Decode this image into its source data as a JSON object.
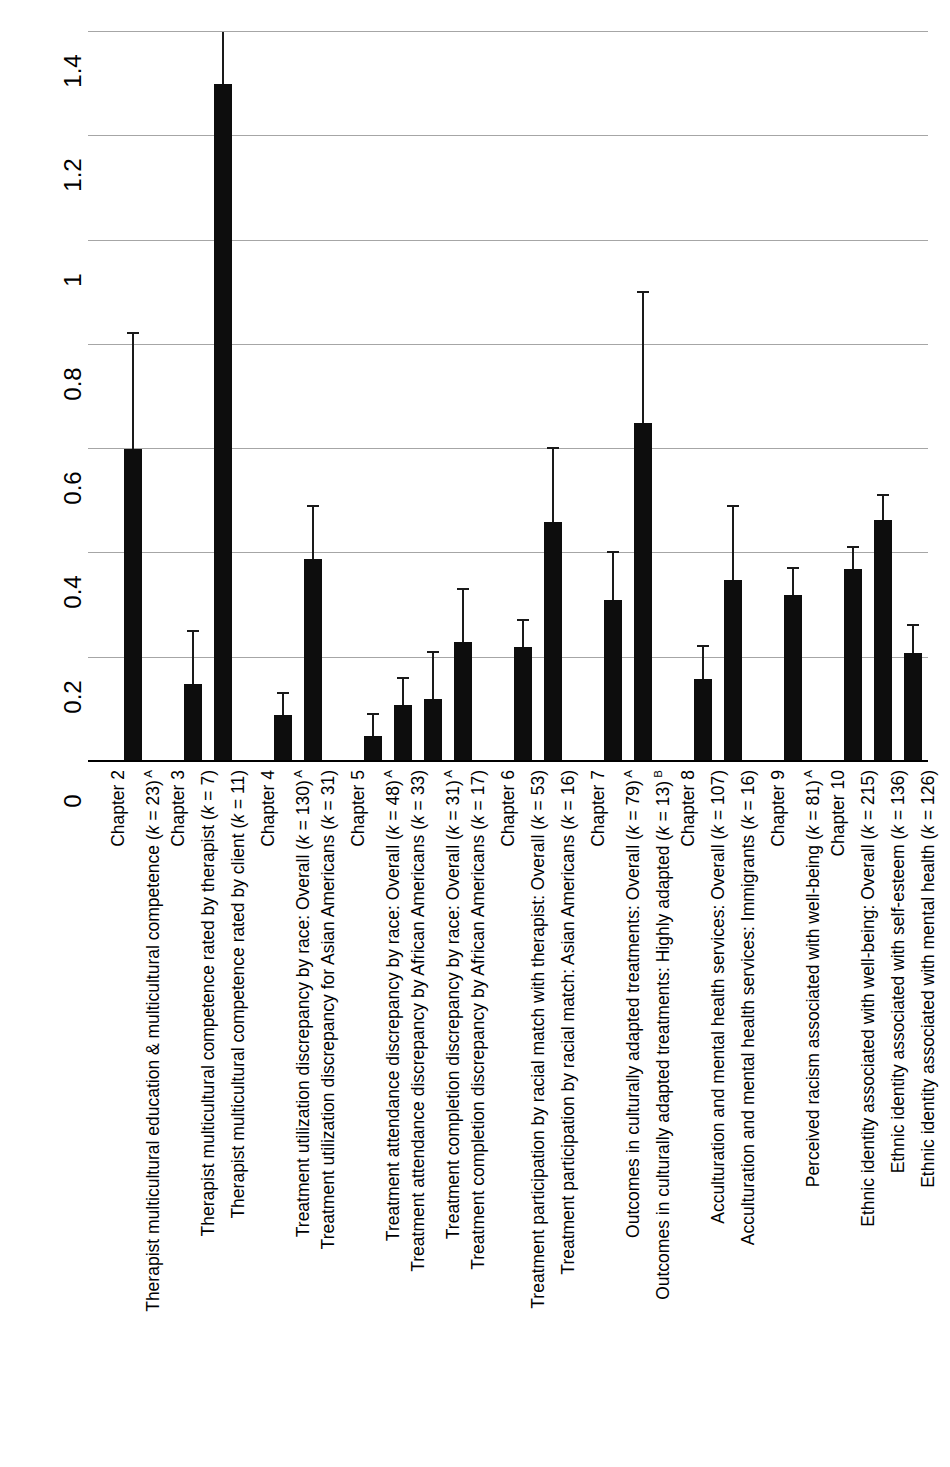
{
  "chart_data": {
    "type": "bar",
    "title": "",
    "xlabel": "",
    "ylabel": "",
    "ylim": [
      0,
      1.4
    ],
    "grid": true,
    "legend": "none",
    "orientation": "vertical-bars-rotated-labels",
    "yticks": [
      "0",
      "0.2",
      "0.4",
      "0.6",
      "0.8",
      "1",
      "1.2",
      "1.4"
    ],
    "ytick_values": [
      0,
      0.2,
      0.4,
      0.6,
      0.8,
      1,
      1.2,
      1.4
    ],
    "categories": [
      "Chapter 2",
      "Therapist multicultural education & multicultural competence (k = 23) A",
      "Chapter 3",
      "Therapist multicultural competence rated by therapist (k = 7)",
      "Therapist multicultural competence rated by client (k = 11)",
      "Chapter 4",
      "Treatment utilization discrepancy by race: Overall (k = 130) A",
      "Treatment utilization discrepancy for Asian Americans (k = 31)",
      "Chapter 5",
      "Treatment attendance discrepancy by race: Overall (k = 48) A",
      "Treatment attendance discrepancy by African Americans (k = 33)",
      "Treatment completion discrepancy by race: Overall (k = 31) A",
      "Treatment completion discrepancy by African Americans (k = 17)",
      "Chapter 6",
      "Treatment participation by racial match with therapist: Overall (k = 53)",
      "Treatment participation by racial match: Asian Americans (k = 16)",
      "Chapter 7",
      "Outcomes in culturally adapted treatments: Overall (k = 79) A",
      "Outcomes in culturally adapted treatments: Highly adapted (k = 13) B",
      "Chapter 8",
      "Acculturation and mental health services: Overall (k = 107)",
      "Acculturation and mental health services: Immigrants (k = 16)",
      "Chapter 9",
      "Perceived racism associated with well-being (k = 81) A",
      "Chapter 10",
      "Ethnic identity associated with well-being: Overall (k = 215)",
      "Ethnic identity associated with self-esteem (k = 136)",
      "Ethnic identity associated with mental health (k = 126)"
    ],
    "values": [
      null,
      0.6,
      null,
      0.15,
      1.3,
      null,
      0.09,
      0.39,
      null,
      0.05,
      0.11,
      0.12,
      0.23,
      null,
      0.22,
      0.46,
      null,
      0.31,
      0.65,
      null,
      0.16,
      0.35,
      null,
      0.32,
      null,
      0.37,
      0.465,
      0.21
    ],
    "error_high": [
      null,
      0.82,
      null,
      0.25,
      1.4,
      null,
      0.13,
      0.49,
      null,
      0.09,
      0.16,
      0.21,
      0.33,
      null,
      0.27,
      0.6,
      null,
      0.4,
      0.9,
      null,
      0.22,
      0.49,
      null,
      0.37,
      null,
      0.41,
      0.51,
      0.26
    ],
    "slots": [
      {
        "label": "Chapter 2",
        "type": "chapter"
      },
      {
        "label": "Therapist multicultural education & multicultural competence (",
        "k": "k",
        "ktail": " = 23)",
        "sup": "A",
        "type": "bar",
        "value": 0.6,
        "error_high": 0.82
      },
      {
        "label": "Chapter 3",
        "type": "chapter"
      },
      {
        "label": "Therapist multicultural competence rated by therapist (",
        "k": "k",
        "ktail": " = 7)",
        "sup": "",
        "type": "bar",
        "value": 0.15,
        "error_high": 0.25
      },
      {
        "label": "Therapist multicultural competence rated by client (",
        "k": "k",
        "ktail": " = 11)",
        "sup": "",
        "type": "bar",
        "value": 1.3,
        "error_high": 1.4
      },
      {
        "label": "Chapter 4",
        "type": "chapter"
      },
      {
        "label": "Treatment utilization discrepancy by race: Overall (",
        "k": "k",
        "ktail": " = 130)",
        "sup": "A",
        "type": "bar",
        "value": 0.09,
        "error_high": 0.13
      },
      {
        "label": "Treatment utilization discrepancy for Asian Americans (",
        "k": "k",
        "ktail": " = 31)",
        "sup": "",
        "type": "bar",
        "value": 0.39,
        "error_high": 0.49
      },
      {
        "label": "Chapter 5",
        "type": "chapter"
      },
      {
        "label": "Treatment attendance discrepancy by race: Overall (",
        "k": "k",
        "ktail": " = 48)",
        "sup": "A",
        "type": "bar",
        "value": 0.05,
        "error_high": 0.09
      },
      {
        "label": "Treatment attendance discrepancy by African Americans (",
        "k": "k",
        "ktail": " = 33)",
        "sup": "",
        "type": "bar",
        "value": 0.11,
        "error_high": 0.16
      },
      {
        "label": "Treatment completion discrepancy by race: Overall (",
        "k": "k",
        "ktail": " = 31)",
        "sup": "A",
        "type": "bar",
        "value": 0.12,
        "error_high": 0.21
      },
      {
        "label": "Treatment completion discrepancy by African Americans (",
        "k": "k",
        "ktail": " = 17)",
        "sup": "",
        "type": "bar",
        "value": 0.23,
        "error_high": 0.33
      },
      {
        "label": "Chapter 6",
        "type": "chapter"
      },
      {
        "label": "Treatment participation by racial match with therapist: Overall (",
        "k": "k",
        "ktail": " = 53)",
        "sup": "",
        "type": "bar",
        "value": 0.22,
        "error_high": 0.27
      },
      {
        "label": "Treatment participation by racial match: Asian Americans (",
        "k": "k",
        "ktail": " = 16)",
        "sup": "",
        "type": "bar",
        "value": 0.46,
        "error_high": 0.6
      },
      {
        "label": "Chapter 7",
        "type": "chapter"
      },
      {
        "label": "Outcomes in culturally adapted treatments: Overall (",
        "k": "k",
        "ktail": " = 79)",
        "sup": "A",
        "type": "bar",
        "value": 0.31,
        "error_high": 0.4
      },
      {
        "label": "Outcomes in culturally adapted treatments: Highly adapted (",
        "k": "k",
        "ktail": " = 13)",
        "sup": "B",
        "type": "bar",
        "value": 0.65,
        "error_high": 0.9
      },
      {
        "label": "Chapter 8",
        "type": "chapter"
      },
      {
        "label": "Acculturation and mental health services: Overall (",
        "k": "k",
        "ktail": " = 107)",
        "sup": "",
        "type": "bar",
        "value": 0.16,
        "error_high": 0.22
      },
      {
        "label": "Acculturation and mental health services: Immigrants (",
        "k": "k",
        "ktail": " = 16)",
        "sup": "",
        "type": "bar",
        "value": 0.35,
        "error_high": 0.49
      },
      {
        "label": "Chapter 9",
        "type": "chapter"
      },
      {
        "label": "Perceived racism associated with well-being (",
        "k": "k",
        "ktail": " = 81)",
        "sup": "A",
        "type": "bar",
        "value": 0.32,
        "error_high": 0.37
      },
      {
        "label": "Chapter 10",
        "type": "chapter"
      },
      {
        "label": "Ethnic identity associated with well-being: Overall (",
        "k": "k",
        "ktail": " = 215)",
        "sup": "",
        "type": "bar",
        "value": 0.37,
        "error_high": 0.41
      },
      {
        "label": "Ethnic identity associated with self-esteem (",
        "k": "k",
        "ktail": " = 136)",
        "sup": "",
        "type": "bar",
        "value": 0.465,
        "error_high": 0.51
      },
      {
        "label": "Ethnic identity associated with mental health (",
        "k": "k",
        "ktail": " = 126)",
        "sup": "",
        "type": "bar",
        "value": 0.21,
        "error_high": 0.26
      }
    ],
    "colors": {
      "bar": "#0d0d0d",
      "error": "#1a1a1a",
      "grid": "#a6a6a6",
      "axis": "#000000",
      "background": "#ffffff"
    }
  }
}
